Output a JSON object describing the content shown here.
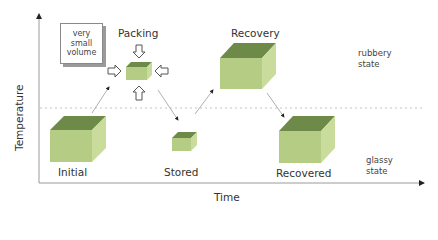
{
  "axes": {
    "y_label": "Temperature",
    "x_label": "Time"
  },
  "states": {
    "upper": [
      "rubbery",
      "state"
    ],
    "lower": [
      "glassy",
      "state"
    ]
  },
  "callout": {
    "lines": [
      "very",
      "small",
      "volume"
    ]
  },
  "stages": [
    {
      "label": "Initial",
      "region": "glassy",
      "size": "large"
    },
    {
      "label": "Packing",
      "region": "rubbery",
      "size": "very small"
    },
    {
      "label": "Stored",
      "region": "glassy",
      "size": "small"
    },
    {
      "label": "Recovery",
      "region": "rubbery",
      "size": "large"
    },
    {
      "label": "Recovered",
      "region": "glassy",
      "size": "large"
    }
  ],
  "colors": {
    "cube_front": "#b4cc84",
    "cube_top": "#6e8a48",
    "cube_side": "#c9dc9c",
    "axis": "#9a9a9a",
    "dashed": "#bdbdbd"
  }
}
